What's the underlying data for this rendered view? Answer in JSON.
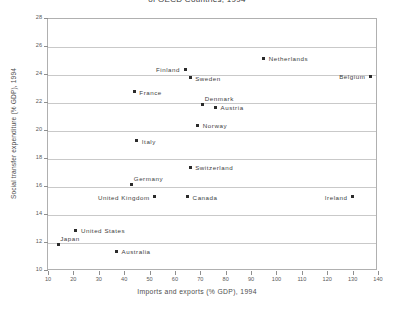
{
  "chart_data": {
    "type": "scatter",
    "title": "of OECD Countries, 1994",
    "xlabel": "Imports and exports (% GDP), 1994",
    "ylabel": "Social transfer expenditure (% GDP), 1994",
    "xlim": [
      10,
      140
    ],
    "ylim": [
      10,
      28
    ],
    "xticks": [
      10,
      20,
      30,
      40,
      50,
      60,
      70,
      80,
      90,
      100,
      110,
      120,
      130,
      140
    ],
    "yticks": [
      10,
      12,
      14,
      16,
      18,
      20,
      22,
      24,
      26,
      28
    ],
    "grid": "horizontal",
    "legend": "none",
    "marker_color": "#2b2b2b",
    "points": [
      {
        "label": "Finland",
        "x": 64,
        "y": 24.4,
        "label_pos": "left"
      },
      {
        "label": "Sweden",
        "x": 66,
        "y": 23.8,
        "label_pos": "right"
      },
      {
        "label": "Netherlands",
        "x": 95,
        "y": 25.2,
        "label_pos": "right"
      },
      {
        "label": "Belgium",
        "x": 137,
        "y": 23.9,
        "label_pos": "left"
      },
      {
        "label": "France",
        "x": 44,
        "y": 22.8,
        "label_pos": "right"
      },
      {
        "label": "Denmark",
        "x": 71,
        "y": 21.9,
        "label_pos": "above-right"
      },
      {
        "label": "Austria",
        "x": 76,
        "y": 21.7,
        "label_pos": "right"
      },
      {
        "label": "Norway",
        "x": 69,
        "y": 20.4,
        "label_pos": "right"
      },
      {
        "label": "Italy",
        "x": 45,
        "y": 19.3,
        "label_pos": "right"
      },
      {
        "label": "Switzerland",
        "x": 66,
        "y": 17.4,
        "label_pos": "right"
      },
      {
        "label": "Germany",
        "x": 43,
        "y": 16.2,
        "label_pos": "above-right"
      },
      {
        "label": "United Kingdom",
        "x": 52,
        "y": 15.3,
        "label_pos": "left"
      },
      {
        "label": "Canada",
        "x": 65,
        "y": 15.3,
        "label_pos": "right"
      },
      {
        "label": "Ireland",
        "x": 130,
        "y": 15.3,
        "label_pos": "left"
      },
      {
        "label": "United States",
        "x": 21,
        "y": 12.9,
        "label_pos": "right"
      },
      {
        "label": "Japan",
        "x": 14,
        "y": 11.9,
        "label_pos": "above-right"
      },
      {
        "label": "Australia",
        "x": 37,
        "y": 11.4,
        "label_pos": "right"
      }
    ]
  }
}
